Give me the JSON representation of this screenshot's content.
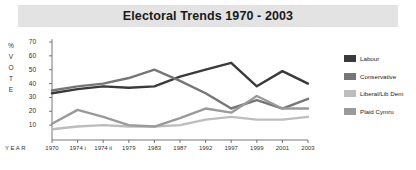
{
  "chart_data": {
    "type": "line",
    "title": "Electoral Trends 1970 - 2003",
    "xlabel": "YEAR",
    "ylabel": "% VOTE",
    "ylim": [
      0,
      70
    ],
    "yticks": [
      70,
      60,
      50,
      40,
      30,
      20,
      10
    ],
    "grid": false,
    "legend_position": "right",
    "categories": [
      "1970",
      "1974 i",
      "1974 ii",
      "1979",
      "1983",
      "1987",
      "1992",
      "1997",
      "1999",
      "2001",
      "2003"
    ],
    "series": [
      {
        "name": "Labour",
        "color": "#3a3a3a",
        "values": [
          33,
          36,
          38,
          37,
          38,
          45,
          50,
          55,
          38,
          49,
          40
        ]
      },
      {
        "name": "Conservative",
        "color": "#767676",
        "values": [
          35,
          38,
          40,
          44,
          50,
          42,
          33,
          22,
          28,
          22,
          29
        ]
      },
      {
        "name": "Liberal/Lib Dem",
        "color": "#bdbdbd",
        "values": [
          7,
          9,
          10,
          9,
          9,
          10,
          14,
          16,
          14,
          14,
          16
        ]
      },
      {
        "name": "Plaid Cymru",
        "color": "#9a9a9a",
        "values": [
          11,
          21,
          16,
          10,
          9,
          15,
          22,
          19,
          31,
          22,
          22
        ]
      }
    ]
  },
  "legend": {
    "items": [
      {
        "label": "Labour",
        "color": "#3a3a3a"
      },
      {
        "label": "Conservative",
        "color": "#767676"
      },
      {
        "label": "Liberal/Lib Dem",
        "color": "#bdbdbd"
      },
      {
        "label": "Plaid Cymru",
        "color": "#9a9a9a"
      }
    ]
  },
  "axis": {
    "vote_chars": [
      "%",
      "V",
      "O",
      "T",
      "E"
    ],
    "year_label": "YEAR"
  }
}
